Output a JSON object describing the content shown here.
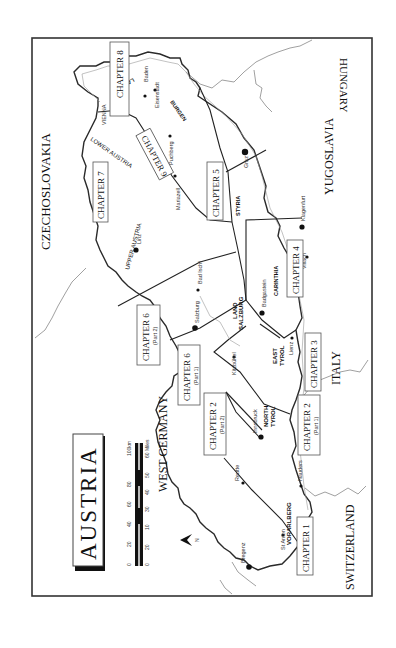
{
  "map": {
    "title": "AUSTRIA",
    "orientation": "rotated 90° counterclockwise (north points left)",
    "north_arrow": {
      "label": "N"
    },
    "scale": {
      "km_labels": [
        "0",
        "20",
        "40",
        "60",
        "80",
        "100km"
      ],
      "mile_labels": [
        "0",
        "20",
        "10",
        "30",
        "40",
        "50",
        "60 Miles"
      ]
    },
    "countries": {
      "czechoslovakia": "CZECHOSLOVAKIA",
      "hungary": "HUNGARY",
      "yugoslavia": "YUGOSLAVIA",
      "italy": "ITALY",
      "switzerland": "SWITZERLAND",
      "west_germany": "WEST GERMANY"
    },
    "regions": {
      "lower_austria": "LOWER AUSTRIA",
      "upper_austria": "UPPER AUSTRIA",
      "burgenland_1": "BURGEN",
      "burgenland_2": "LAND",
      "styria": "STYRIA",
      "carinthia": "CARINTHIA",
      "land_salzburg_1": "LAND",
      "land_salzburg_2": "SALZBURG",
      "east_tyrol_1": "EAST",
      "east_tyrol_2": "TYROL",
      "north_tyrol_1": "NORTH",
      "north_tyrol_2": "TYROL",
      "vorarlberg": "VORARLBERG"
    },
    "cities": {
      "vienna": "VIENNA",
      "baden": "Baden",
      "eisenstadt": "Eisenstadt",
      "puchberg": "Puchberg",
      "mariazell": "Mariazell",
      "graz": "Graz",
      "linz": "Linz",
      "bad_ischl": "Bad Ischl",
      "salzburg": "Salzburg",
      "badgastein": "Badgastein",
      "klagenfurt": "Klagenfurt",
      "villach": "Villach",
      "lienz": "Lienz",
      "kitzbuhel": "Kitzbühel",
      "innsbruck": "Innsbruck",
      "reutte": "Reutte",
      "nauders": "Nauders",
      "st_anton": "St Anton",
      "bregenz": "Bregenz"
    },
    "chapters": {
      "ch1": {
        "label": "CHAPTER 1",
        "sub": ""
      },
      "ch2_p1": {
        "label": "CHAPTER 2",
        "sub": "(Part 1)"
      },
      "ch2_p2": {
        "label": "CHAPTER 2",
        "sub": "(Part 2)"
      },
      "ch3": {
        "label": "CHAPTER 3",
        "sub": ""
      },
      "ch4": {
        "label": "CHAPTER 4",
        "sub": ""
      },
      "ch5": {
        "label": "CHAPTER 5",
        "sub": ""
      },
      "ch6_p1": {
        "label": "CHAPTER 6",
        "sub": "(Part 1)"
      },
      "ch6_p2": {
        "label": "CHAPTER 6",
        "sub": "(Part 2)"
      },
      "ch7": {
        "label": "CHAPTER 7",
        "sub": ""
      },
      "ch8": {
        "label": "CHAPTER 8",
        "sub": ""
      },
      "ch9": {
        "label": "CHAPTER 9",
        "sub": ""
      }
    },
    "colors": {
      "ink": "#111111",
      "border_gray": "#777777",
      "background": "#ffffff"
    }
  }
}
